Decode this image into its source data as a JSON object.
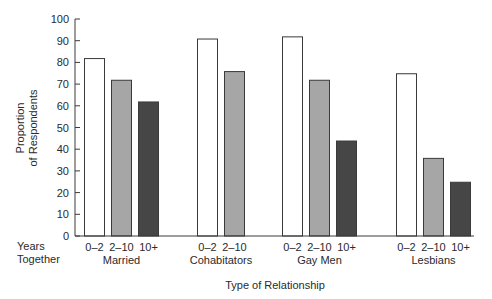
{
  "chart_data": {
    "type": "bar",
    "title": "",
    "xlabel": "Type of Relationship",
    "ylabel": [
      "Proportion",
      "of Respondents"
    ],
    "ylim": [
      0,
      100
    ],
    "yticks": [
      0,
      10,
      20,
      30,
      40,
      50,
      60,
      70,
      80,
      90,
      100
    ],
    "grid": false,
    "legend": null,
    "row_label": [
      "Years",
      "Together"
    ],
    "groups": [
      {
        "name": "Married",
        "bars": [
          {
            "label": "0–2",
            "value": 82
          },
          {
            "label": "2–10",
            "value": 72
          },
          {
            "label": "10+",
            "value": 62
          }
        ]
      },
      {
        "name": "Cohabitators",
        "bars": [
          {
            "label": "0–2",
            "value": 91
          },
          {
            "label": "2–10",
            "value": 76
          }
        ]
      },
      {
        "name": "Gay Men",
        "bars": [
          {
            "label": "0–2",
            "value": 92
          },
          {
            "label": "2–10",
            "value": 72
          },
          {
            "label": "10+",
            "value": 44
          }
        ]
      },
      {
        "name": "Lesbians",
        "bars": [
          {
            "label": "0–2",
            "value": 75
          },
          {
            "label": "2–10",
            "value": 36
          },
          {
            "label": "10+",
            "value": 25
          }
        ]
      }
    ],
    "bar_colors": {
      "0–2": "#ffffff",
      "2–10": "#a6a6a6",
      "10+": "#464646"
    }
  }
}
